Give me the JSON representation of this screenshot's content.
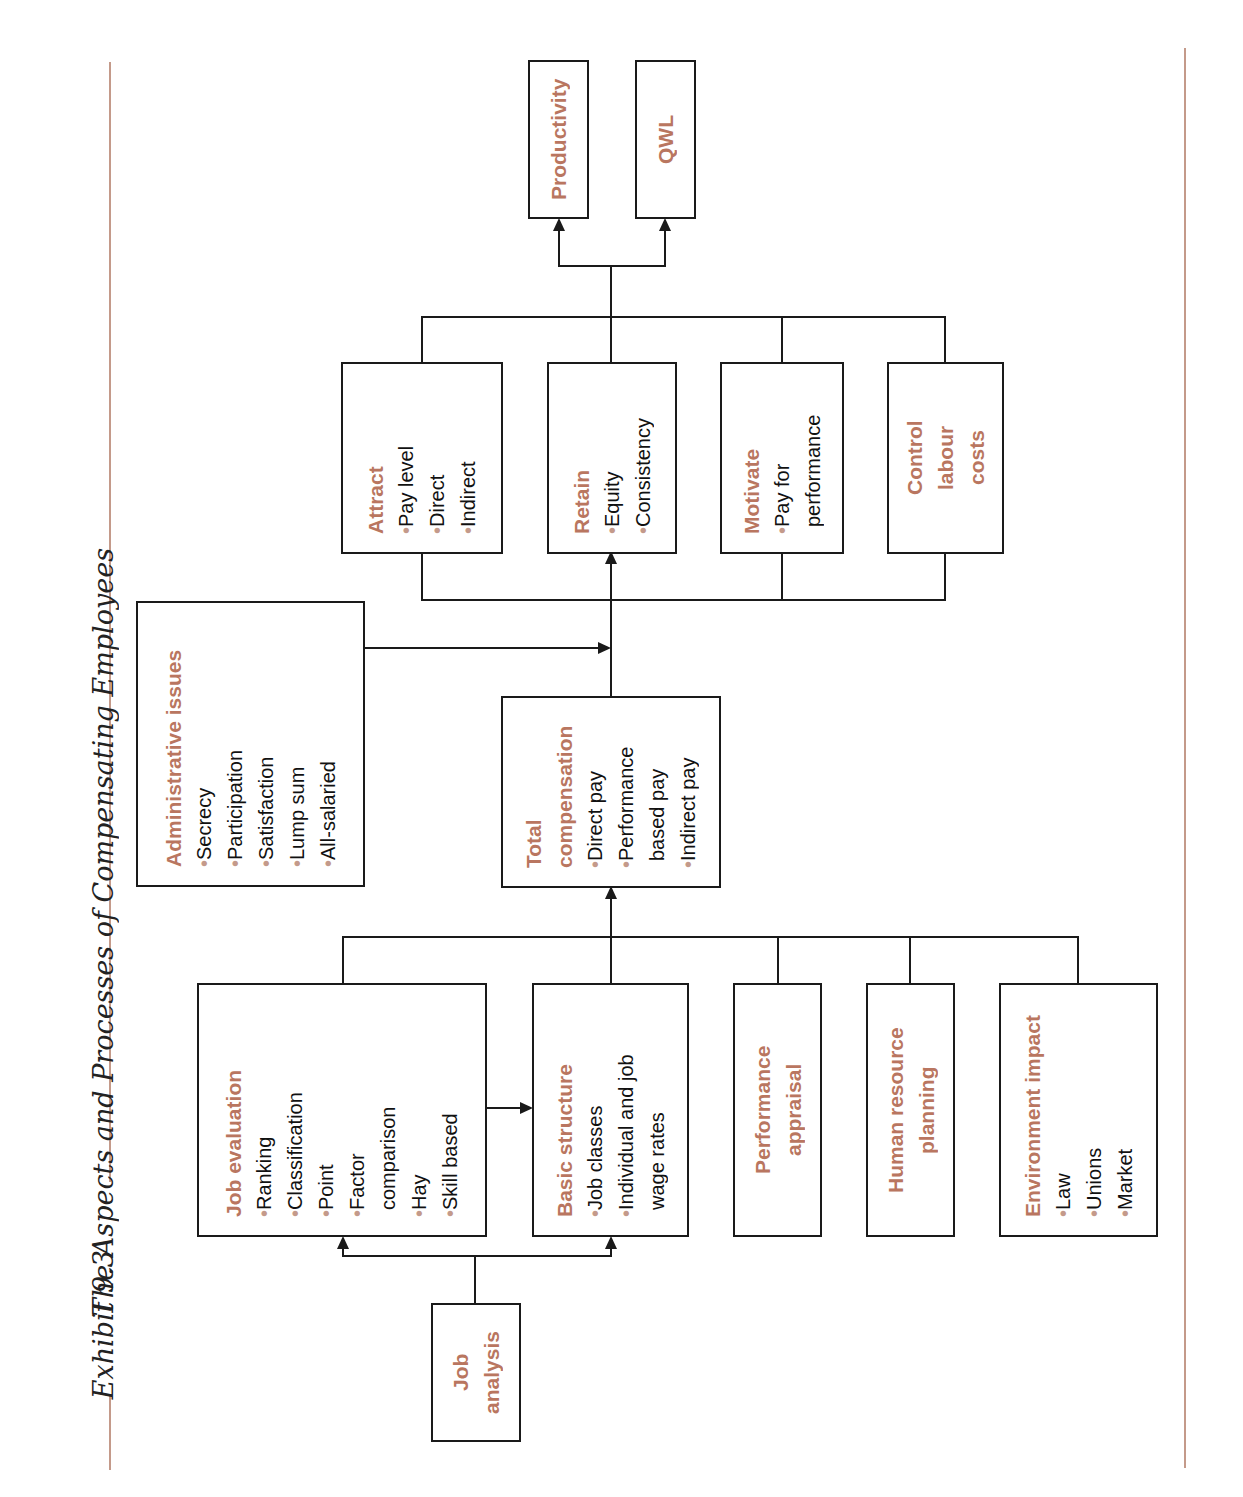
{
  "caption": {
    "exhibit": "Exhibit 9.3",
    "title": "The Aspects and Processes of Compensating Employees"
  },
  "colors": {
    "accent": "#b97660",
    "rule": "#c49a8a",
    "line": "#1a1a1a"
  },
  "nodes": {
    "job_analysis": {
      "title": "Job\nanalysis"
    },
    "job_evaluation": {
      "title": "Job evaluation",
      "items": [
        "Ranking",
        "Classification",
        "Point",
        "Factor\ncomparison",
        "Hay",
        "Skill based"
      ]
    },
    "basic_structure": {
      "title": "Basic structure",
      "items": [
        "Job classes",
        "Individual and job\nwage rates"
      ]
    },
    "performance_appraisal": {
      "title": "Performance\nappraisal"
    },
    "hr_planning": {
      "title": "Human resource\nplanning"
    },
    "environment_impact": {
      "title": "Environment impact",
      "items": [
        "Law",
        "Unions",
        "Market"
      ]
    },
    "total_compensation": {
      "title": "Total\ncompensation",
      "items": [
        "Direct pay",
        "Performance\nbased pay",
        "Indirect pay"
      ]
    },
    "administrative_issues": {
      "title": "Administrative issues",
      "items": [
        "Secrecy",
        "Participation",
        "Satisfaction",
        "Lump sum",
        "All-salaried"
      ]
    },
    "attract": {
      "title": "Attract",
      "items": [
        "Pay level",
        "Direct",
        "Indirect"
      ]
    },
    "retain": {
      "title": "Retain",
      "items": [
        "Equity",
        "Consistency"
      ]
    },
    "motivate": {
      "title": "Motivate",
      "items": [
        "Pay for\nperformance"
      ]
    },
    "control_costs": {
      "title": "Control\nlabour\ncosts"
    },
    "productivity": {
      "title": "Productivity"
    },
    "qwl": {
      "title": "QWL"
    }
  },
  "bullet_glyph": "•"
}
